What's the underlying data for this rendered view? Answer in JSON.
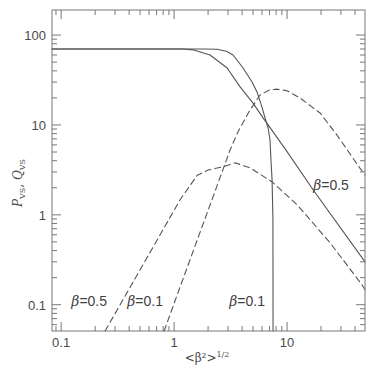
{
  "chart_data": {
    "type": "line",
    "title": "",
    "xlabel": "<β²>",
    "xlabel_sup": "1/2",
    "ylabel": "P_VS, Q_VS",
    "ylabel_parts": {
      "p": "P",
      "p_sub": "VS",
      "sep": ", ",
      "q": "Q",
      "q_sub": "VS"
    },
    "xscale": "log",
    "yscale": "log",
    "xlim": [
      0.083,
      49
    ],
    "ylim": [
      0.051,
      190
    ],
    "grid": false,
    "legend": null,
    "xticks": [
      {
        "value": 0.1,
        "label": "0.1"
      },
      {
        "value": 1,
        "label": "1"
      },
      {
        "value": 10,
        "label": "10"
      }
    ],
    "yticks": [
      {
        "value": 0.1,
        "label": "0.1"
      },
      {
        "value": 1,
        "label": "1"
      },
      {
        "value": 10,
        "label": "10"
      },
      {
        "value": 100,
        "label": "100"
      }
    ],
    "series": [
      {
        "name": "P_VS (β=0.1)",
        "style": "solid",
        "points": [
          [
            0.083,
            70
          ],
          [
            1.2,
            70
          ],
          [
            1.8,
            70
          ],
          [
            2.4,
            69.5
          ],
          [
            2.9,
            66
          ],
          [
            3.33,
            60
          ],
          [
            4.08,
            43
          ],
          [
            4.9,
            30
          ],
          [
            5.42,
            23.3
          ],
          [
            6.0,
            15.8
          ],
          [
            6.39,
            12
          ],
          [
            6.8,
            9.25
          ],
          [
            7.07,
            6.8
          ],
          [
            7.2,
            4.1
          ],
          [
            7.37,
            2.45
          ],
          [
            7.5,
            0.88
          ],
          [
            7.52,
            0.051
          ]
        ]
      },
      {
        "name": "P_VS (β=0.5)",
        "style": "solid",
        "points": [
          [
            0.083,
            70
          ],
          [
            1.2,
            70
          ],
          [
            1.47,
            68.5
          ],
          [
            2.08,
            60
          ],
          [
            2.95,
            43
          ],
          [
            3.84,
            26.5
          ],
          [
            5.0,
            17.5
          ],
          [
            6.13,
            12
          ],
          [
            6.8,
            10
          ],
          [
            10,
            5.04
          ],
          [
            17,
            1.9
          ],
          [
            49,
            0.3
          ]
        ]
      },
      {
        "name": "Q_VS (β=0.1)",
        "style": "dashed",
        "points": [
          [
            0.816,
            0.051
          ],
          [
            1.13,
            0.158
          ],
          [
            2.21,
            1.58
          ],
          [
            3.13,
            5.27
          ],
          [
            3.68,
            8.4
          ],
          [
            4.6,
            14
          ],
          [
            5.76,
            21.5
          ],
          [
            7.0,
            24.5
          ],
          [
            8.2,
            25
          ],
          [
            10,
            24
          ],
          [
            13,
            20
          ],
          [
            19.6,
            13.6
          ],
          [
            27.7,
            7.7
          ],
          [
            44,
            3.33
          ],
          [
            49,
            2.78
          ]
        ]
      },
      {
        "name": "Q_VS (β=0.5)",
        "style": "dashed",
        "points": [
          [
            0.245,
            0.051
          ],
          [
            1.13,
            1.47
          ],
          [
            1.6,
            2.75
          ],
          [
            2.0,
            3.15
          ],
          [
            2.71,
            3.42
          ],
          [
            3.47,
            3.79
          ],
          [
            4.7,
            3.33
          ],
          [
            7.37,
            2.33
          ],
          [
            12.3,
            1.29
          ],
          [
            24,
            0.49
          ],
          [
            46,
            0.167
          ],
          [
            49,
            0.147
          ]
        ]
      }
    ],
    "annotations": [
      {
        "symbol": "β",
        "value": "=0.5",
        "x": 0.177,
        "y": 0.111
      },
      {
        "symbol": "β",
        "value": "=0.1",
        "x": 0.554,
        "y": 0.111
      },
      {
        "symbol": "β",
        "value": "=0.1",
        "x": 4.43,
        "y": 0.111
      },
      {
        "symbol": "β",
        "value": "=0.5",
        "x": 24.5,
        "y": 2.15
      }
    ]
  },
  "colors": {
    "line": "#555555",
    "axis": "#777777",
    "text": "#4a4a4a",
    "background": "#ffffff"
  }
}
